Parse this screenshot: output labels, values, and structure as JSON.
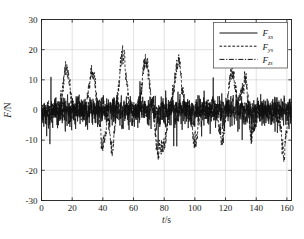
{
  "chart_data": {
    "type": "line",
    "title": "",
    "xlabel": "t/s",
    "ylabel": "F/N",
    "xlim": [
      0,
      163
    ],
    "ylim": [
      -30,
      30
    ],
    "xticks": [
      0,
      20,
      40,
      60,
      80,
      100,
      120,
      140,
      160
    ],
    "xtick_labels": [
      "0",
      "20",
      "40",
      "60",
      "80",
      "100",
      "120",
      "140",
      "160"
    ],
    "yticks": [
      -30,
      -20,
      -10,
      0,
      10,
      20,
      30
    ],
    "ytick_labels": [
      "-30",
      "-20",
      "-10",
      "0",
      "10",
      "20",
      "30"
    ],
    "grid": true,
    "legend_position": "upper right",
    "series": [
      {
        "name": "Fxs",
        "label_base": "F",
        "label_sub": "xs",
        "style": "solid",
        "color": "#111111",
        "description": "high-frequency noisy cutting force about 0 N, range roughly -13 to +11 N",
        "noise_amplitude": 4.2,
        "mean": -0.6,
        "spike_amplitude": 7.0,
        "seed": 17
      },
      {
        "name": "Fys",
        "label_base": "F",
        "label_sub": "ys",
        "style": "dashed",
        "color": "#111111",
        "description": "noisy signal with large periodic peaks reaching 13-18 N and troughs near -13 N",
        "noise_amplitude": 2.6,
        "mean": -0.4,
        "seed": 43,
        "peaks": [
          {
            "t": 16,
            "amp": 13.4
          },
          {
            "t": 33,
            "amp": 13.3
          },
          {
            "t": 53,
            "amp": 18.0
          },
          {
            "t": 68,
            "amp": 17.0
          },
          {
            "t": 89,
            "amp": 17.2
          },
          {
            "t": 124,
            "amp": 12.8
          },
          {
            "t": 133,
            "amp": 10.6
          }
        ],
        "troughs": [
          {
            "t": 40,
            "amp": -11.8
          },
          {
            "t": 46,
            "amp": -12.2
          },
          {
            "t": 76,
            "amp": -13.3
          },
          {
            "t": 80,
            "amp": -11.5
          },
          {
            "t": 100,
            "amp": -10.0
          },
          {
            "t": 118,
            "amp": -9.6
          },
          {
            "t": 137,
            "amp": -10.4
          },
          {
            "t": 158,
            "amp": -13.8
          }
        ]
      },
      {
        "name": "Fzs",
        "label_base": "F",
        "label_sub": "zs",
        "style": "dashdot",
        "color": "#111111",
        "description": "low-amplitude noisy signal hovering near 0 N, range roughly -5 to +5 N",
        "noise_amplitude": 2.2,
        "mean": 0.2,
        "seed": 91
      }
    ]
  },
  "legend": {
    "entries": [
      {
        "label_base": "F",
        "label_sub": "xs",
        "style": "solid"
      },
      {
        "label_base": "F",
        "label_sub": "ys",
        "style": "dashed"
      },
      {
        "label_base": "F",
        "label_sub": "zs",
        "style": "dashdot"
      }
    ]
  },
  "colors": {
    "axis": "#1a1a1a",
    "grid": "#cccccc",
    "trace": "#111111",
    "background": "#ffffff",
    "legend_border": "#555555"
  }
}
